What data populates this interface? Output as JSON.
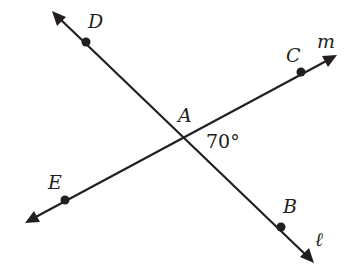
{
  "diagram": {
    "colors": {
      "stroke": "#231f20",
      "background": "#ffffff"
    },
    "lines": [
      {
        "name": "l",
        "label": "ℓ",
        "through": [
          "D",
          "A",
          "B"
        ]
      },
      {
        "name": "m",
        "label": "m",
        "through": [
          "E",
          "A",
          "C"
        ]
      }
    ],
    "points": [
      {
        "name": "D",
        "label": "D"
      },
      {
        "name": "C",
        "label": "C"
      },
      {
        "name": "A",
        "label": "A"
      },
      {
        "name": "E",
        "label": "E"
      },
      {
        "name": "B",
        "label": "B"
      }
    ],
    "angle": {
      "vertex": "A",
      "between": [
        "C",
        "B"
      ],
      "label": "70°"
    },
    "labels": {
      "D": "D",
      "C": "C",
      "m": "m",
      "A": "A",
      "angle": "70°",
      "E": "E",
      "B": "B",
      "l": "ℓ"
    }
  }
}
